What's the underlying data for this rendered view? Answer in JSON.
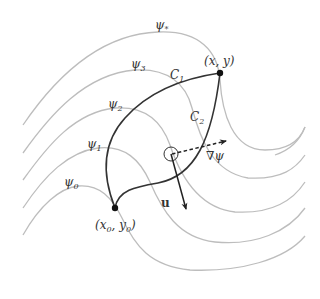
{
  "figure": {
    "type": "level-set diagram",
    "colors": {
      "level_curves": "#bdbdbd",
      "paths": "#333333",
      "arrows": "#222222",
      "background": "#ffffff"
    },
    "level_curves": [
      {
        "id": "psi0",
        "label": "ψ",
        "subscript": "0"
      },
      {
        "id": "psi1",
        "label": "ψ",
        "subscript": "1"
      },
      {
        "id": "psi2",
        "label": "ψ",
        "subscript": "2"
      },
      {
        "id": "psi3",
        "label": "ψ",
        "subscript": "3"
      },
      {
        "id": "psistar",
        "label": "ψ",
        "subscript": "*"
      }
    ],
    "paths": [
      {
        "id": "C1",
        "label": "C",
        "subscript": "1"
      },
      {
        "id": "C2",
        "label": "C",
        "subscript": "2"
      }
    ],
    "points": {
      "start": {
        "label": "(x",
        "sub": "0",
        "mid": ", y",
        "sub2": "0",
        "end": ")"
      },
      "end": {
        "label": "(x, y)"
      }
    },
    "vectors": {
      "gradient": {
        "label": "∇ψ",
        "style": "dashed"
      },
      "velocity": {
        "label": "u",
        "style": "solid-bold"
      }
    }
  }
}
